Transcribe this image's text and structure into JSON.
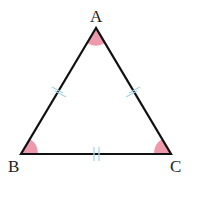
{
  "diagram": {
    "type": "equilateral-triangle",
    "vertices": {
      "A": {
        "label": "A",
        "x": 96,
        "y": 28
      },
      "B": {
        "label": "B",
        "x": 21,
        "y": 154
      },
      "C": {
        "label": "C",
        "x": 171,
        "y": 154
      }
    },
    "equal_sides_marks": [
      "AB",
      "AC",
      "BC"
    ],
    "equal_angle_marks": [
      "A",
      "B",
      "C"
    ],
    "colors": {
      "stroke": "#111111",
      "angle_fill": "#ee9aac",
      "tick": "#a8d4e6"
    }
  }
}
